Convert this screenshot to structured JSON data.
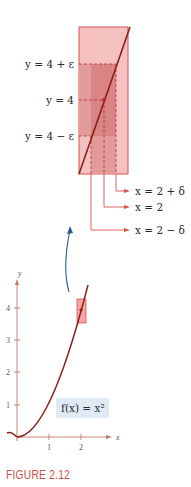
{
  "figure": {
    "caption": "FIGURE 2.12",
    "function_label": "f(x) = x²",
    "zoom_labels": {
      "y_upper": "y = 4 + ε",
      "y_mid": "y = 4",
      "y_lower": "y = 4 − ε",
      "x_upper": "x = 2 + δ",
      "x_mid": "x = 2",
      "x_lower": "x = 2 − δ"
    },
    "axis": {
      "x_name": "x",
      "y_name": "y",
      "x_ticks": [
        "1",
        "2"
      ],
      "y_ticks": [
        "1",
        "2",
        "3",
        "4"
      ]
    },
    "colors": {
      "curve": "#8b1f1a",
      "rect_light": "#f2b3b3",
      "rect_dark": "#df8a8a",
      "rect_border": "#d9534f",
      "arrow": "#2b5b8a",
      "label_box": "#dfeaf5",
      "axis": "#c0786a",
      "caption": "#c8504a"
    }
  }
}
